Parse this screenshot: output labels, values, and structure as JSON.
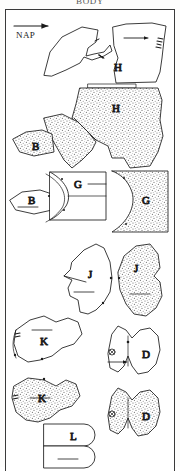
{
  "sheet": {
    "heading": "BODY",
    "grain_label": "NAP",
    "grain_icon": "right-arrow-icon",
    "background_color": "#ffffff",
    "ink_color": "#1a1a1a",
    "border_color": "#3a3a3a",
    "stipple_color": "#6b6b6b"
  },
  "pieces": [
    {
      "id": "h-plain",
      "label": "H",
      "fill": "plain",
      "row": 1,
      "notes": "large upper body panel with directional arrow and notch marks"
    },
    {
      "id": "h-wing-plain",
      "label": "",
      "fill": "plain",
      "row": 1,
      "notes": "hook shaped companion panel at upper left"
    },
    {
      "id": "h-stippled",
      "label": "H",
      "fill": "stippled",
      "row": 2,
      "notes": "mirrored H panel rendered with stipple texture"
    },
    {
      "id": "b-stippled",
      "label": "B",
      "fill": "stippled",
      "row": 3,
      "notes": "small wedge piece, stippled"
    },
    {
      "id": "b-plain",
      "label": "B",
      "fill": "plain",
      "row": 4,
      "notes": "small wedge piece, plain outline with grain line"
    },
    {
      "id": "g-plain",
      "label": "G",
      "fill": "plain",
      "row": 4,
      "notes": "rectangular panel with concave curved edge and leader line"
    },
    {
      "id": "g-stippled",
      "label": "G",
      "fill": "stippled",
      "row": 4,
      "notes": "mirrored G panel, stippled"
    },
    {
      "id": "j-plain",
      "label": "J",
      "fill": "plain",
      "row": 5,
      "notes": "side panel with notch and grain line"
    },
    {
      "id": "j-stippled",
      "label": "J",
      "fill": "stippled",
      "row": 5,
      "notes": "mirrored J panel, stippled"
    },
    {
      "id": "k-plain",
      "label": "K",
      "fill": "plain",
      "row": 6,
      "notes": "irregular panel with seam dots along left edge"
    },
    {
      "id": "d-plain",
      "label": "D",
      "fill": "plain",
      "row": 6,
      "notes": "twin-lobed panel with circled registration mark"
    },
    {
      "id": "k-stippled",
      "label": "K",
      "fill": "stippled",
      "row": 7,
      "notes": "mirrored K panel, stippled"
    },
    {
      "id": "d-stippled",
      "label": "D",
      "fill": "stippled",
      "row": 7,
      "notes": "mirrored D panel, stippled"
    },
    {
      "id": "l-plain",
      "label": "L",
      "fill": "plain",
      "row": 8,
      "notes": "two stacked strips with rounded right ends"
    }
  ],
  "marks": {
    "registration_icon": "circled-cross-icon",
    "notch_icon": "notch-tick-icon",
    "grain_line_icon": "grain-line-icon",
    "seam_dot_icon": "seam-dot-icon"
  }
}
